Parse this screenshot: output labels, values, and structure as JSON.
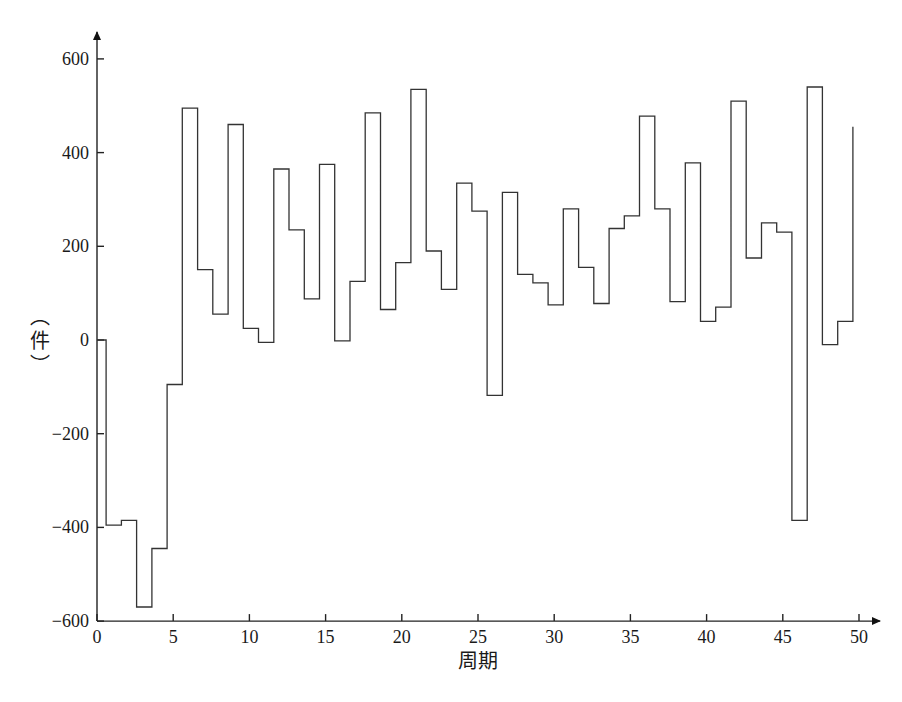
{
  "chart_data": {
    "type": "line",
    "style": "step",
    "title": "",
    "xlabel": "周期",
    "ylabel": "（件）",
    "xlim": [
      0,
      50
    ],
    "ylim": [
      -600,
      600
    ],
    "xticks": [
      0,
      5,
      10,
      15,
      20,
      25,
      30,
      35,
      40,
      45,
      50
    ],
    "yticks": [
      -600,
      -400,
      -200,
      0,
      200,
      400,
      600
    ],
    "grid": false,
    "legend": null,
    "series": [
      {
        "name": "net inventory",
        "x": [
          0,
          1,
          2,
          3,
          4,
          5,
          6,
          7,
          8,
          9,
          10,
          11,
          12,
          13,
          14,
          15,
          16,
          17,
          18,
          19,
          20,
          21,
          22,
          23,
          24,
          25,
          26,
          27,
          28,
          29,
          30,
          31,
          32,
          33,
          34,
          35,
          36,
          37,
          38,
          39,
          40,
          41,
          42,
          43,
          44,
          45,
          46,
          47,
          48,
          49,
          50
        ],
        "values": [
          0,
          -395,
          -385,
          -570,
          -445,
          -95,
          495,
          150,
          55,
          460,
          25,
          -5,
          365,
          235,
          88,
          375,
          -2,
          125,
          485,
          65,
          165,
          535,
          190,
          108,
          335,
          275,
          -118,
          315,
          140,
          122,
          75,
          280,
          155,
          78,
          238,
          265,
          478,
          280,
          82,
          378,
          40,
          70,
          510,
          175,
          250,
          230,
          -385,
          540,
          -10,
          40,
          455
        ]
      }
    ]
  },
  "labels": {
    "xlabel": "周期",
    "ylabel_char": "件",
    "ylabel_paren_open": "︵",
    "ylabel_paren_close": "︶"
  }
}
